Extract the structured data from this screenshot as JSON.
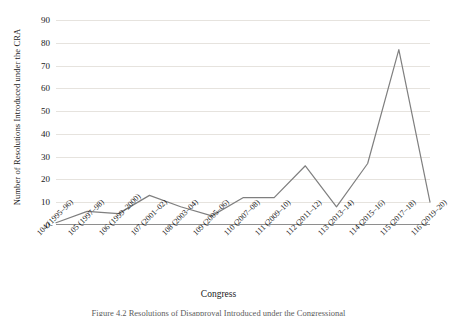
{
  "chart_data": {
    "type": "line",
    "title": "",
    "xlabel": "Congress",
    "ylabel": "Number of Resolutions Introduced under the CRA",
    "categories": [
      "104 (1995–96)",
      "105 (1997–98)",
      "106 (1999–2000)",
      "107 (2001–02)",
      "108 (2003–04)",
      "109 (2005–06)",
      "110 (2007–08)",
      "111 (2009–10)",
      "112 (2011–12)",
      "113 (2013–14)",
      "114 (2015–16)",
      "115 (2017–18)",
      "116 (2019–20)"
    ],
    "values": [
      1,
      6,
      5,
      13,
      8,
      4,
      12,
      12,
      26,
      8,
      27,
      77,
      10
    ],
    "ylim": [
      0,
      90
    ],
    "yticks": [
      0,
      10,
      20,
      30,
      40,
      50,
      60,
      70,
      80,
      90
    ],
    "grid": true,
    "legend": false,
    "series_color": "#7f7f7f",
    "grid_color": "#e6e3de",
    "axis_color": "#8e8e8e"
  },
  "caption": "Figure 4.2  Resolutions of Disapproval Introduced under the Congressional"
}
